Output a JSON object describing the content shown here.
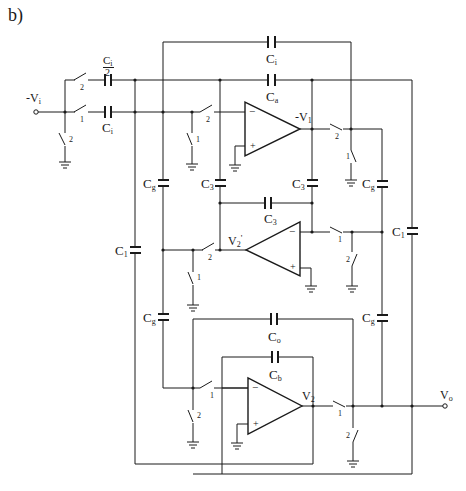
{
  "figure": {
    "panel_label": "b)",
    "caption": ""
  },
  "nodes": {
    "input": "-V",
    "input_sub": "i",
    "v1": "-V",
    "v1_sub": "1",
    "v2p": "V",
    "v2p_sub": "2",
    "v2p_prime": "'",
    "v2": "V",
    "v2_sub": "2",
    "output": "V",
    "output_sub": "o"
  },
  "capacitors": {
    "ci_half_num": "C",
    "ci_half_num_sub": "i",
    "ci_half_den": "2",
    "ci_input": "C",
    "ci_input_sub": "i",
    "ci_top": "C",
    "ci_top_sub": "i",
    "ca": "C",
    "ca_sub": "a",
    "cg1": "C",
    "cg1_sub": "g",
    "c3_left": "C",
    "c3_left_sub": "3",
    "c3_right": "C",
    "c3_right_sub": "3",
    "c3_mid": "C",
    "c3_mid_sub": "3",
    "cg_right": "C",
    "cg_right_sub": "g",
    "c1_left": "C",
    "c1_left_sub": "1",
    "c1_right": "C",
    "c1_right_sub": "1",
    "cg2": "C",
    "cg2_sub": "g",
    "cg_right2": "C",
    "cg_right2_sub": "g",
    "co": "C",
    "co_sub": "o",
    "cb": "C",
    "cb_sub": "b"
  },
  "switch_phases": {
    "s_in_top": "2",
    "s_in_main": "1",
    "s_in_gnd": "2",
    "s_oa1_in": "2",
    "s_oa1_gnd": "1",
    "s_oa1_out": "2",
    "s_oa1_out_gnd": "1",
    "s_oa2_in": "2",
    "s_oa2_in_gnd": "1",
    "s_oa2_out": "1",
    "s_oa2_out_gnd": "2",
    "s_oa3_in": "1",
    "s_oa3_in_gnd": "2",
    "s_oa3_out": "1",
    "s_oa3_out_gnd": "2"
  },
  "opamps": {
    "minus": "−",
    "plus": "+"
  },
  "colors": {
    "ink": "#1a1a1a",
    "background": "#ffffff"
  }
}
